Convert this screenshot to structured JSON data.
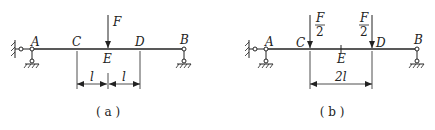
{
  "panels": [
    {
      "id": "a",
      "caption": "( a )",
      "points": {
        "A": "A",
        "B": "B",
        "C": "C",
        "D": "D",
        "E": "E"
      },
      "loads": [
        {
          "label": "F",
          "at": "E"
        }
      ],
      "dimensions": [
        {
          "label": "l",
          "from": "C",
          "to": "E"
        },
        {
          "label": "l",
          "from": "E",
          "to": "D"
        }
      ],
      "supports": {
        "A": "pinned (wall + ground)",
        "B": "roller"
      }
    },
    {
      "id": "b",
      "caption": "( b )",
      "points": {
        "A": "A",
        "B": "B",
        "C": "C",
        "D": "D",
        "E": "E"
      },
      "loads": [
        {
          "numerator": "F",
          "denominator": "2",
          "at": "C"
        },
        {
          "numerator": "F",
          "denominator": "2",
          "at": "D"
        }
      ],
      "dimensions": [
        {
          "label": "2l",
          "from": "C",
          "to": "D"
        }
      ],
      "supports": {
        "A": "pinned (wall + ground)",
        "B": "roller"
      }
    }
  ]
}
